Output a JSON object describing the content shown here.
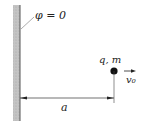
{
  "diagram": {
    "wall_label": "φ = 0",
    "particle_label": "q, m",
    "velocity_label": "v₀",
    "distance_label": "a",
    "colors": {
      "wall": "#b8b8b8",
      "ink": "#222222"
    }
  }
}
